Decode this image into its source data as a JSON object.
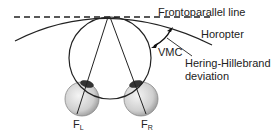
{
  "diagram": {
    "labels": {
      "frontoparallel": "Frontoparallel line",
      "horopter": "Horopter",
      "vmc": "VMC",
      "hh_line1": "Hering-Hillebrand",
      "hh_line2": "deviation",
      "fovea_left_main": "F",
      "fovea_left_sub": "L",
      "fovea_right_main": "F",
      "fovea_right_sub": "R"
    },
    "colors": {
      "stroke": "#222222",
      "eye_fill": "#d8d8d8",
      "pupil": "#333333"
    }
  }
}
